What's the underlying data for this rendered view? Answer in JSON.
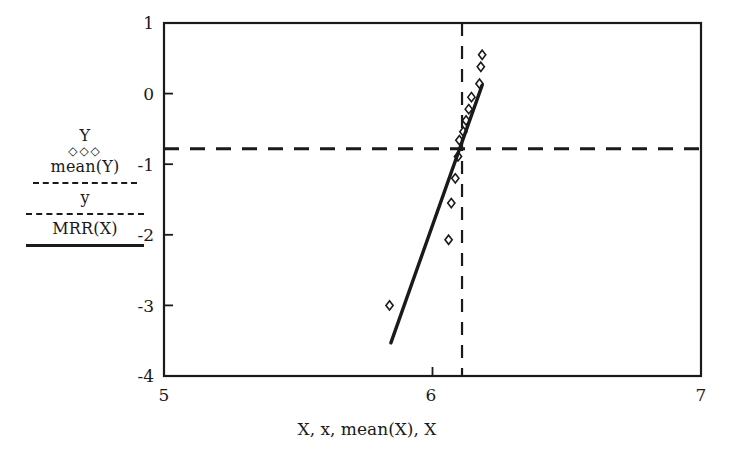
{
  "chart_data": {
    "type": "scatter",
    "title": "",
    "xlabel": "X, x, mean(X), X",
    "ylabel": "",
    "xlim": [
      5,
      7
    ],
    "ylim": [
      -4,
      1
    ],
    "xticks": [
      "5",
      "6",
      "7"
    ],
    "xtick_values": [
      5,
      6,
      7
    ],
    "yticks": [
      "1",
      "0",
      "-1",
      "-2",
      "-3",
      "-4"
    ],
    "ytick_values": [
      1,
      0,
      -1,
      -2,
      -3,
      -4
    ],
    "grid": false,
    "legend_position": "left-outside",
    "series": [
      {
        "name": "Y",
        "type": "scatter",
        "marker": "diamond",
        "points": [
          {
            "x": 5.84,
            "y": -3.0
          },
          {
            "x": 6.06,
            "y": -2.07
          },
          {
            "x": 6.07,
            "y": -1.55
          },
          {
            "x": 6.085,
            "y": -1.2
          },
          {
            "x": 6.095,
            "y": -0.89
          },
          {
            "x": 6.1,
            "y": -0.66
          },
          {
            "x": 6.115,
            "y": -0.54
          },
          {
            "x": 6.125,
            "y": -0.38
          },
          {
            "x": 6.135,
            "y": -0.22
          },
          {
            "x": 6.145,
            "y": -0.05
          },
          {
            "x": 6.175,
            "y": 0.14
          },
          {
            "x": 6.18,
            "y": 0.38
          },
          {
            "x": 6.185,
            "y": 0.55
          }
        ]
      },
      {
        "name": "mean(Y)",
        "type": "hline",
        "style": "dashed",
        "y": -0.78
      },
      {
        "name": "y",
        "type": "vline",
        "style": "dashed",
        "x": 6.11
      },
      {
        "name": "MRR(X)",
        "type": "line",
        "style": "solid",
        "endpoints": [
          {
            "x": 5.845,
            "y": -3.53
          },
          {
            "x": 6.185,
            "y": 0.12
          }
        ]
      }
    ],
    "annotations": []
  },
  "legend": {
    "entries": [
      {
        "label": "Y",
        "sample": "diamond-markers"
      },
      {
        "label": "mean(Y)",
        "sample": "dashed-line"
      },
      {
        "label": "y",
        "sample": "dashed-line"
      },
      {
        "label": "MRR(X)",
        "sample": "solid-line"
      }
    ],
    "markers_glyph": "◇◇◇"
  },
  "axes": {
    "x_title": "X, x, mean(X), X",
    "x_tick_labels": [
      "5",
      "6",
      "7"
    ],
    "y_tick_labels": [
      "1",
      "0",
      "-1",
      "-2",
      "-3",
      "-4"
    ]
  },
  "colors": {
    "foreground": "#1a1a1a",
    "background": "#ffffff"
  }
}
